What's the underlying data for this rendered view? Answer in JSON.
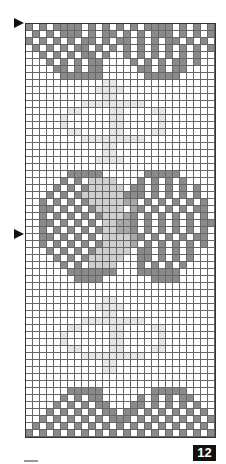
{
  "chart": {
    "columns": 27,
    "rows": 59,
    "colors": {
      ".": "#ffffff",
      "d": "#8a8a8a",
      "m": "#a8a8a8",
      "l": "#cfcfcf",
      "x": "#e6e6e6"
    },
    "pattern": [
      "d.d.dddd.d.d.d.d.dddd.d.d.d",
      ".d.d.ddd.d.dd.d.d.ddd.d.d.d",
      "d.d.d.d.dd.d.dd.d.d.dd.d.d.",
      ".d.d.d.dd.d.d.d.d.d.d.d.d.d",
      "..d.d.d.dd.d..d.d.d.d.d.d..",
      "...d.d.d.dd....d.d.d.dd.d..",
      "....dd.d.dd.....dd.d.dd....",
      ".....dddddd......ddddd.....",
      "...........xx..............",
      "..........xxxx.............",
      "...........xx..............",
      "........xxxxxxxxx..........",
      "......xx....xx....xx.......",
      ".....x......xx.....x.......",
      ".....x......xx.....x.......",
      "......xx....xx....xx.......",
      "........xxxxxxxxx..........",
      "...........xx..............",
      "...........xx..............",
      "..........xxxx.............",
      "...........................",
      "......ddddd......ddddd.....",
      ".....d.d.llll...d.d.d.d....",
      "....d.d.dlllll.dd.d.d.d.d..",
      "...d.d.dllllllddd.d.d.d.d..",
      "..d.d.d.dlllllmm.d.d.d.d.d.",
      "..dd.d.d.dllll.md.d.d.d.dd.",
      "..d.d.d.d.dlllmd.d.d.d.d.d.",
      "..dd.d.d.d.llmmd.d.d.d.d.dd",
      "..d.d.d.d.dllmmd.d.d.d.d.d.",
      "..dd.d.d.d.llllmd.d.d.d.dd.",
      "..d.d.d.d.dllllm.d.d.d.d.d.",
      "...d.d.d.dlllll.dd.d.d.d...",
      "....d.d.dlllll..dd.d.d.d...",
      ".....d.d.llll...d.d.d.d....",
      "......ddddddd...dddddd.....",
      ".......dddd.......dddd.....",
      "...........................",
      "...........................",
      "...........xx..............",
      "..........xxxx.............",
      "...........xx..............",
      "........xxxxxxxxx..........",
      "......xx....xx....xx.......",
      ".....x......xx.....x.......",
      ".....x......xx.....x.......",
      "......xx....xx....xx.......",
      "........xxxxxxxxx..........",
      "...........xx..............",
      "...........xx..............",
      "...........................",
      "...........................",
      "......ddddd.......ddddd....",
      ".....d.d.dd.....d.d.d.dd...",
      "....d.d.d.dd...dd.d.d.d.d..",
      "...d.d.d.d.dd.dd.d.d.d.d.d.",
      "..d.d.d.d.d.ddd.d.d.d.d.d.d",
      ".d.d.d.d.d.d.d.d.d.d.d.d.d.",
      "d.d.d.d.d.d.d.d.d.d.d.d.d.d"
    ]
  },
  "markers": [
    {
      "name": "row-marker-top",
      "top": 18
    },
    {
      "name": "row-marker-middle",
      "top": 229
    }
  ],
  "page": {
    "number": "12"
  }
}
